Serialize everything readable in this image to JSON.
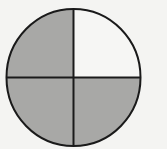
{
  "diagram": {
    "type": "fraction-circle",
    "parts_total": 4,
    "parts_shaded": 3,
    "fraction_shaded": "3/4",
    "quadrants": [
      {
        "position": "top-left",
        "shaded": true
      },
      {
        "position": "top-right",
        "shaded": false
      },
      {
        "position": "bottom-left",
        "shaded": true
      },
      {
        "position": "bottom-right",
        "shaded": true
      }
    ],
    "colors": {
      "background": "#f4f4f2",
      "shaded": "#a8a8a6",
      "unshaded": "#f6f6f4",
      "stroke": "#1a1a1a"
    }
  }
}
